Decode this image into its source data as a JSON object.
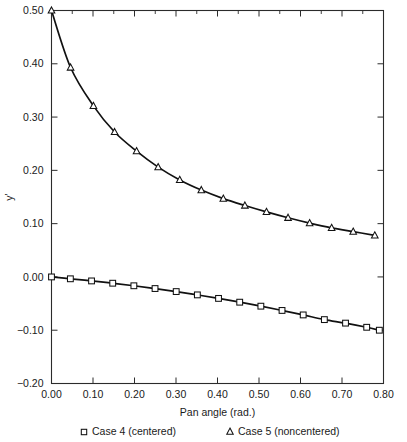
{
  "chart_data": {
    "type": "line",
    "title": "",
    "xlabel": "Pan angle (rad.)",
    "ylabel": "y'",
    "xlim": [
      0.0,
      0.8
    ],
    "ylim": [
      -0.2,
      0.5
    ],
    "xticks": [
      0.0,
      0.1,
      0.2,
      0.3,
      0.4,
      0.5,
      0.6,
      0.7,
      0.8
    ],
    "yticks": [
      -0.2,
      -0.1,
      0.0,
      0.1,
      0.2,
      0.3,
      0.4,
      0.5
    ],
    "xtick_labels": [
      "0.00",
      "0.10",
      "0.20",
      "0.30",
      "0.40",
      "0.50",
      "0.60",
      "0.70",
      "0.80"
    ],
    "ytick_labels": [
      "-0.20",
      "-0.10",
      "0.00",
      "0.10",
      "0.20",
      "0.30",
      "0.40",
      "0.50"
    ],
    "grid": false,
    "legend_position": "below-axes",
    "minor_xticks": [
      0.05,
      0.15,
      0.25,
      0.35,
      0.45,
      0.55,
      0.65,
      0.75
    ],
    "series": [
      {
        "name": "Case 4 (centered)",
        "marker": "square",
        "x": [
          0.0,
          0.0455,
          0.0965,
          0.1475,
          0.1985,
          0.2495,
          0.3005,
          0.3515,
          0.4025,
          0.4535,
          0.5045,
          0.5555,
          0.6065,
          0.6575,
          0.7085,
          0.7595,
          0.79
        ],
        "y": [
          0.0,
          -0.0035,
          -0.0075,
          -0.0118,
          -0.0166,
          -0.0218,
          -0.0275,
          -0.0337,
          -0.0403,
          -0.0474,
          -0.0549,
          -0.0629,
          -0.0713,
          -0.0801,
          -0.0867,
          -0.0945,
          -0.1
        ]
      },
      {
        "name": "Case 5 (noncentered)",
        "marker": "triangle",
        "x": [
          0.0,
          0.046,
          0.101,
          0.152,
          0.205,
          0.257,
          0.309,
          0.361,
          0.414,
          0.466,
          0.518,
          0.57,
          0.622,
          0.675,
          0.727,
          0.779
        ],
        "y": [
          0.5,
          0.393,
          0.321,
          0.272,
          0.236,
          0.206,
          0.182,
          0.163,
          0.147,
          0.134,
          0.122,
          0.111,
          0.101,
          0.092,
          0.085,
          0.078
        ]
      }
    ]
  },
  "legend": {
    "entries": [
      {
        "marker_name": "square-marker",
        "label": "Case 4 (centered)"
      },
      {
        "marker_name": "triangle-marker",
        "label": "Case 5 (noncentered)"
      }
    ]
  },
  "colors": {
    "line": "#111111",
    "frame": "#2b2b2b",
    "text": "#1a1a1a",
    "background": "#ffffff",
    "marker_fill": "#ffffff"
  }
}
